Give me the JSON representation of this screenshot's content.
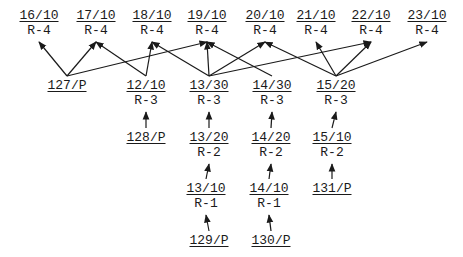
{
  "diagram": {
    "type": "directed-graph",
    "colors": {
      "line": "#1a1a1a",
      "text": "#1a1a1a",
      "background": "#ffffff"
    },
    "nodes": [
      {
        "id": "16/10",
        "rank": "R-4",
        "x": 39,
        "y": 8
      },
      {
        "id": "17/10",
        "rank": "R-4",
        "x": 96,
        "y": 8
      },
      {
        "id": "18/10",
        "rank": "R-4",
        "x": 152,
        "y": 8
      },
      {
        "id": "19/10",
        "rank": "R-4",
        "x": 207,
        "y": 8
      },
      {
        "id": "20/10",
        "rank": "R-4",
        "x": 265,
        "y": 8
      },
      {
        "id": "21/10",
        "rank": "R-4",
        "x": 316,
        "y": 8
      },
      {
        "id": "22/10",
        "rank": "R-4",
        "x": 371,
        "y": 8
      },
      {
        "id": "23/10",
        "rank": "R-4",
        "x": 427,
        "y": 8
      },
      {
        "id": "127/P",
        "rank": "",
        "x": 67,
        "y": 78
      },
      {
        "id": "12/10",
        "rank": "R-3",
        "x": 146,
        "y": 78
      },
      {
        "id": "13/30",
        "rank": "R-3",
        "x": 209,
        "y": 78
      },
      {
        "id": "14/30",
        "rank": "R-3",
        "x": 272,
        "y": 78
      },
      {
        "id": "15/20",
        "rank": "R-3",
        "x": 336,
        "y": 78
      },
      {
        "id": "128/P",
        "rank": "",
        "x": 146,
        "y": 130
      },
      {
        "id": "13/20",
        "rank": "R-2",
        "x": 209,
        "y": 130
      },
      {
        "id": "14/20",
        "rank": "R-2",
        "x": 271,
        "y": 130
      },
      {
        "id": "15/10",
        "rank": "R-2",
        "x": 332,
        "y": 130
      },
      {
        "id": "13/10",
        "rank": "R-1",
        "x": 206,
        "y": 181
      },
      {
        "id": "14/10",
        "rank": "R-1",
        "x": 269,
        "y": 181
      },
      {
        "id": "131/P",
        "rank": "",
        "x": 332,
        "y": 181
      },
      {
        "id": "129/P",
        "rank": "",
        "x": 209,
        "y": 233
      },
      {
        "id": "130/P",
        "rank": "",
        "x": 271,
        "y": 233
      }
    ],
    "edges": [
      {
        "from": "127/P",
        "to": "16/10"
      },
      {
        "from": "127/P",
        "to": "17/10"
      },
      {
        "from": "127/P",
        "to": "19/10"
      },
      {
        "from": "12/10",
        "to": "17/10"
      },
      {
        "from": "12/10",
        "to": "18/10"
      },
      {
        "from": "13/30",
        "to": "18/10"
      },
      {
        "from": "13/30",
        "to": "19/10"
      },
      {
        "from": "13/30",
        "to": "20/10"
      },
      {
        "from": "13/30",
        "to": "22/10"
      },
      {
        "from": "14/30",
        "to": "19/10"
      },
      {
        "from": "15/20",
        "to": "20/10"
      },
      {
        "from": "15/20",
        "to": "21/10"
      },
      {
        "from": "15/20",
        "to": "22/10"
      },
      {
        "from": "15/20",
        "to": "23/10"
      },
      {
        "from": "128/P",
        "to": "12/10"
      },
      {
        "from": "13/20",
        "to": "13/30"
      },
      {
        "from": "14/20",
        "to": "14/30"
      },
      {
        "from": "15/10",
        "to": "15/20"
      },
      {
        "from": "13/10",
        "to": "13/20"
      },
      {
        "from": "14/10",
        "to": "14/20"
      },
      {
        "from": "131/P",
        "to": "15/10"
      },
      {
        "from": "129/P",
        "to": "13/10"
      },
      {
        "from": "130/P",
        "to": "14/10"
      }
    ]
  }
}
